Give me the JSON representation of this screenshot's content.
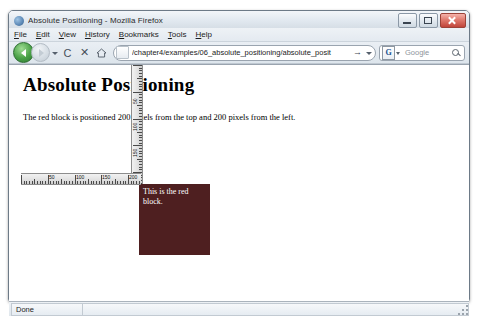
{
  "window": {
    "title": "Absolute Positioning - Mozilla Firefox",
    "logo_icon": "firefox-logo-icon",
    "controls": {
      "minimize": "Minimize",
      "maximize": "Maximize",
      "close": "Close"
    }
  },
  "menubar": {
    "items": [
      {
        "label": "File",
        "accel": "F"
      },
      {
        "label": "Edit",
        "accel": "E"
      },
      {
        "label": "View",
        "accel": "V"
      },
      {
        "label": "History",
        "accel": "H"
      },
      {
        "label": "Bookmarks",
        "accel": "B"
      },
      {
        "label": "Tools",
        "accel": "T"
      },
      {
        "label": "Help",
        "accel": "H"
      }
    ]
  },
  "navbar": {
    "back_icon": "back-arrow-icon",
    "forward_icon": "forward-arrow-icon",
    "history_dropdown_icon": "chevron-down-icon",
    "reload_label": "C",
    "reload_icon": "reload-icon",
    "stop_label": "✕",
    "stop_icon": "stop-icon",
    "home_icon": "home-icon",
    "url": {
      "value": "/chapter4/examples/06_absolute_positioning/absolute_posit",
      "placeholder": "Go to a Web Site",
      "favicon": "page-favicon-icon",
      "go_label": "→",
      "dropdown_icon": "chevron-down-icon"
    },
    "search": {
      "engine_label": "G",
      "engine_icon": "google-icon",
      "placeholder": "Google",
      "value": "",
      "magnifier_icon": "search-icon",
      "dropdown_icon": "chevron-down-icon"
    }
  },
  "page": {
    "heading": "Absolute Positioning",
    "paragraph": "The red block is positioned 200 pixels from the top and 200 pixels from the left.",
    "red_block": {
      "text": "This is the red block.",
      "color": "#4e1f20",
      "text_color": "#ffffff",
      "top_px": 200,
      "left_px": 200
    },
    "ruler_vertical": {
      "name": "vertical-ruler",
      "labels": [
        "50",
        "100",
        "150",
        "200"
      ]
    },
    "ruler_horizontal": {
      "name": "horizontal-ruler",
      "labels": [
        "50",
        "100",
        "150",
        "200"
      ]
    }
  },
  "statusbar": {
    "text": "Done",
    "resize_grip_icon": "resize-grip-icon"
  }
}
